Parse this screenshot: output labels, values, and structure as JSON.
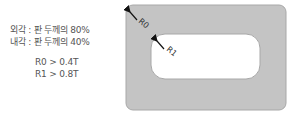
{
  "notes": {
    "outer": "외각 : 판 두께의 80%",
    "inner": "내각 : 판 두께의 40%",
    "r0_rule": "R0 > 0.4T",
    "r1_rule": "R1 > 0.8T"
  },
  "diagram": {
    "outer_label": "R0",
    "inner_label": "R1",
    "plate_color": "#c4c4c4",
    "plate_border": "#a8a8a8",
    "hole_color": "#ffffff"
  }
}
